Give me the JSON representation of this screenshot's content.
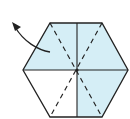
{
  "diagram": {
    "type": "origami-fold-step",
    "shape": "hexagon",
    "colors": {
      "paper_colored": "#d5eef6",
      "paper_white": "#ffffff",
      "line": "#222222"
    },
    "regions": [
      {
        "name": "top-half",
        "shaded": true
      },
      {
        "name": "bottom-right-quadrant",
        "shaded": true
      },
      {
        "name": "bottom-left-quadrant",
        "shaded": false
      }
    ],
    "lines": [
      {
        "type": "solid",
        "name": "horizontal-crease"
      },
      {
        "type": "solid",
        "name": "vertical-crease"
      },
      {
        "type": "dashed",
        "name": "valley-fold-left-diagonal"
      },
      {
        "type": "dashed",
        "name": "valley-fold-right-diagonal"
      }
    ],
    "arrow": {
      "direction": "up-left",
      "meaning": "fold-behind"
    }
  }
}
